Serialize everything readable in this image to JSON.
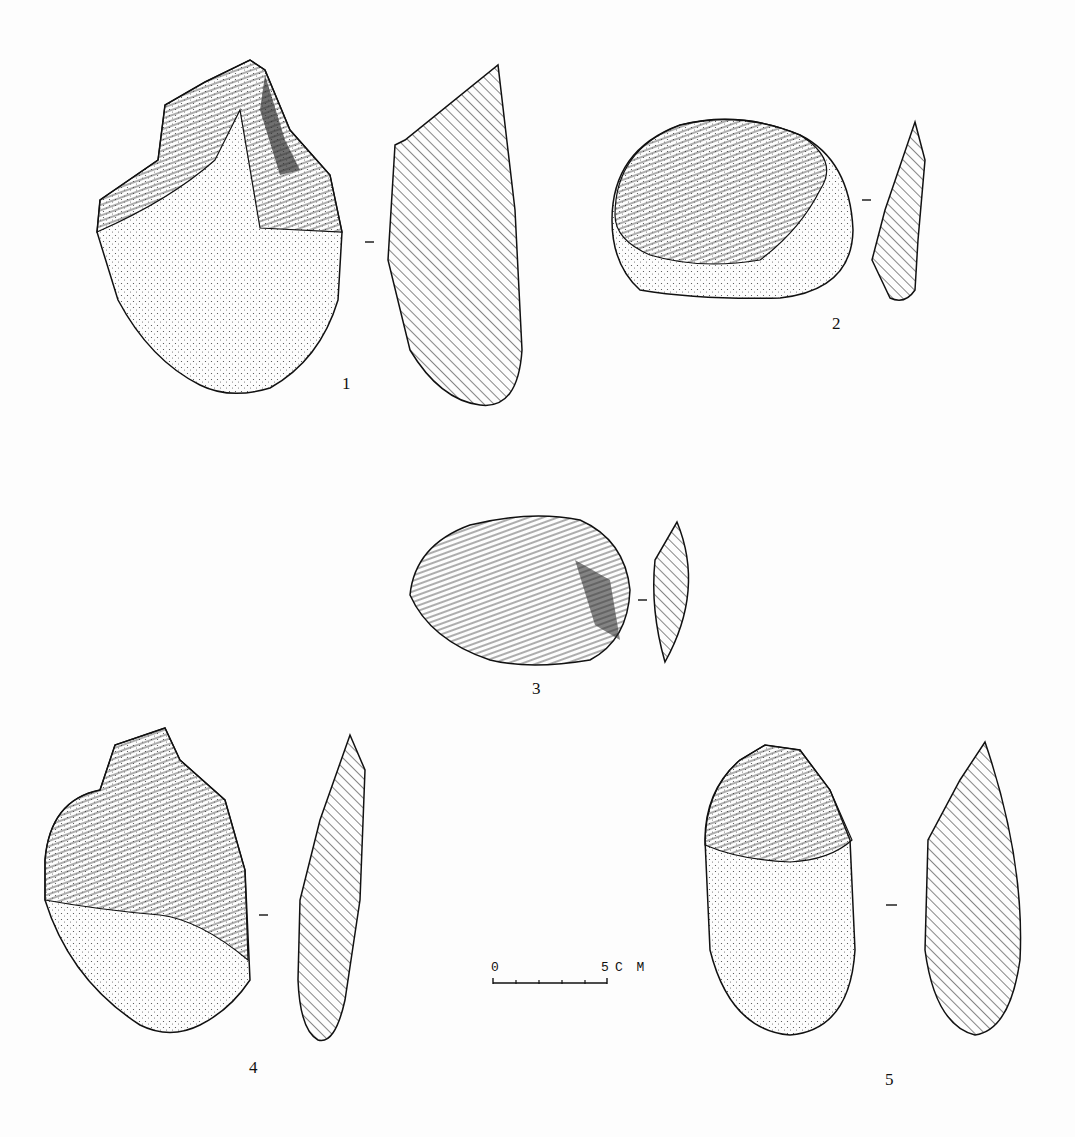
{
  "plate": {
    "figures": [
      {
        "id": 1,
        "label": "1"
      },
      {
        "id": 2,
        "label": "2"
      },
      {
        "id": 3,
        "label": "3"
      },
      {
        "id": 4,
        "label": "4"
      },
      {
        "id": 5,
        "label": "5"
      }
    ],
    "scale_bar": {
      "start": "0",
      "end": "5",
      "unit": "C M"
    }
  },
  "colors": {
    "ink": "#111111",
    "paper": "#fdfdfd",
    "stipple": "#444444"
  }
}
